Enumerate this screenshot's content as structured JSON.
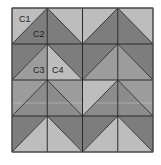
{
  "diagram": {
    "type": "quilt-block-grid",
    "rows": 4,
    "cols": 4,
    "origin": [
      12,
      8
    ],
    "cell_w": 35.25,
    "cell_h": 36,
    "colors": {
      "light": "#bdbdbd",
      "medium": "#9c9c9c",
      "medium_dark": "#8c8c8c",
      "dark": "#7d7d7d",
      "line": "#2a2a2a",
      "highlight_band": "#c4c4c4"
    },
    "cells": [
      [
        {
          "diag": "up",
          "outer": "light",
          "inner": "dark"
        },
        {
          "diag": "down",
          "outer": "light",
          "inner": "dark"
        },
        {
          "diag": "up",
          "outer": "light",
          "inner": "dark"
        },
        {
          "diag": "down",
          "outer": "light",
          "inner": "dark"
        }
      ],
      [
        {
          "diag": "up",
          "outer": "dark",
          "inner": "medium"
        },
        {
          "diag": "down",
          "outer": "dark",
          "inner": "light"
        },
        {
          "diag": "up",
          "outer": "dark",
          "inner": "medium"
        },
        {
          "diag": "down",
          "outer": "dark",
          "inner": "medium"
        }
      ],
      [
        {
          "diag": "up",
          "outer": "medium",
          "inner": "medium_dark"
        },
        {
          "diag": "down",
          "outer": "medium",
          "inner": "medium_dark"
        },
        {
          "diag": "up",
          "outer": "light",
          "inner": "medium_dark"
        },
        {
          "diag": "down",
          "outer": "medium",
          "inner": "medium_dark"
        }
      ],
      [
        {
          "diag": "up",
          "outer": "dark",
          "inner": "light"
        },
        {
          "diag": "down",
          "outer": "dark",
          "inner": "light"
        },
        {
          "diag": "up",
          "outer": "dark",
          "inner": "light"
        },
        {
          "diag": "down",
          "outer": "dark",
          "inner": "light"
        }
      ]
    ],
    "labels": [
      {
        "text": "C1",
        "x": 19,
        "y": 22
      },
      {
        "text": "C2",
        "x": 33,
        "y": 37
      },
      {
        "text": "C3",
        "x": 33,
        "y": 73
      },
      {
        "text": "C4",
        "x": 52,
        "y": 73
      }
    ]
  }
}
